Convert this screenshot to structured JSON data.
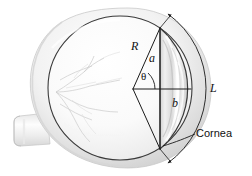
{
  "figure": {
    "background_color": "#ffffff",
    "width": 252,
    "height": 176,
    "line_color": "#1a1a1a",
    "sclera_fill": "#f4f4f4",
    "shell_fill": "#e8e8e8",
    "interior_fill": "#fbfbfb",
    "cornea_fill": "#e3e3e3"
  },
  "labels": {
    "radius": "R",
    "half_chord": "a",
    "depth": "b",
    "angle": "θ",
    "arc_length": "L",
    "cornea": "Cornea"
  },
  "parts": {
    "eyeball": "eyeball",
    "optic_nerve": "optic-nerve",
    "retinal_vessels": "retinal-vessels",
    "cornea_bulge": "cornea-bulge",
    "outer_shell": "outer-shell"
  },
  "geometry": {
    "vertex": {
      "x": 133,
      "y": 89
    },
    "chord_x": 160,
    "chord_top": {
      "x": 160,
      "y": 28
    },
    "chord_bottom": {
      "x": 160,
      "y": 149
    },
    "globe_center": {
      "x": 120,
      "y": 88
    },
    "globe_radius": 72,
    "theta_degrees": 45
  }
}
